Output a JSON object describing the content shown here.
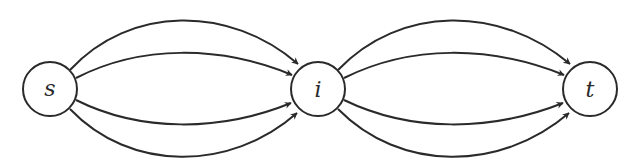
{
  "diagram": {
    "type": "directed-multigraph",
    "nodes": [
      {
        "id": "s",
        "label": "s",
        "cx": 50,
        "cy": 89,
        "r": 27
      },
      {
        "id": "i",
        "label": "i",
        "cx": 318,
        "cy": 89,
        "r": 27
      },
      {
        "id": "t",
        "label": "t",
        "cx": 590,
        "cy": 89,
        "r": 27
      }
    ],
    "edges": [
      {
        "from": "s",
        "to": "i",
        "index": 0
      },
      {
        "from": "s",
        "to": "i",
        "index": 1
      },
      {
        "from": "s",
        "to": "i",
        "index": 2
      },
      {
        "from": "s",
        "to": "i",
        "index": 3
      },
      {
        "from": "i",
        "to": "t",
        "index": 0
      },
      {
        "from": "i",
        "to": "t",
        "index": 1
      },
      {
        "from": "i",
        "to": "t",
        "index": 2
      },
      {
        "from": "i",
        "to": "t",
        "index": 3
      }
    ],
    "stroke_color": "#2a2a2a",
    "background": "#ffffff"
  }
}
